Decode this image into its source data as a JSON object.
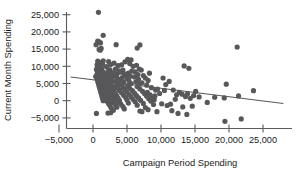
{
  "chart_data": {
    "type": "scatter",
    "title": "",
    "xlabel": "Campaign Period Spending",
    "ylabel": "Current Month Spending",
    "xlim": [
      -6500,
      28500
    ],
    "ylim": [
      -7500,
      27000
    ],
    "xticks": [
      -5000,
      0,
      5000,
      10000,
      15000,
      20000,
      25000
    ],
    "xticklabels": [
      "−5,000",
      "0",
      "5,000",
      "10,000",
      "15,000",
      "20,000",
      "25,000"
    ],
    "yticks": [
      -5000,
      0,
      5000,
      10000,
      15000,
      20000,
      25000
    ],
    "yticklabels": [
      "−5,000",
      "0",
      "5,000",
      "10,000",
      "15,000",
      "20,000",
      "25,000"
    ],
    "grid": false,
    "legend": null,
    "marker_color": "#58585a",
    "marker_size": 2.6,
    "trendline": {
      "label": "linear fit",
      "color": "#58585a",
      "x0": -3300,
      "y0": 6900,
      "x1": 28000,
      "y1": -800
    },
    "points": [
      [
        800,
        25700
      ],
      [
        1500,
        19000
      ],
      [
        700,
        17300
      ],
      [
        900,
        17100
      ],
      [
        1100,
        16800
      ],
      [
        450,
        16300
      ],
      [
        3400,
        16300
      ],
      [
        6900,
        16200
      ],
      [
        21200,
        15600
      ],
      [
        6500,
        15300
      ],
      [
        1200,
        15200
      ],
      [
        900,
        14900
      ],
      [
        1050,
        14700
      ],
      [
        5100,
        12000
      ],
      [
        5600,
        11900
      ],
      [
        1500,
        11600
      ],
      [
        700,
        11500
      ],
      [
        2300,
        11400
      ],
      [
        4700,
        11300
      ],
      [
        1000,
        11100
      ],
      [
        3100,
        10900
      ],
      [
        5400,
        10800
      ],
      [
        900,
        10700
      ],
      [
        1400,
        10600
      ],
      [
        2600,
        10500
      ],
      [
        600,
        10400
      ],
      [
        4200,
        10400
      ],
      [
        6400,
        10300
      ],
      [
        1100,
        10200
      ],
      [
        3700,
        10200
      ],
      [
        13400,
        10100
      ],
      [
        5900,
        10000
      ],
      [
        800,
        9900
      ],
      [
        2000,
        9900
      ],
      [
        14100,
        9400
      ],
      [
        1300,
        9300
      ],
      [
        3300,
        9200
      ],
      [
        6800,
        9200
      ],
      [
        500,
        9100
      ],
      [
        2500,
        9000
      ],
      [
        4400,
        8900
      ],
      [
        7100,
        8900
      ],
      [
        1000,
        8800
      ],
      [
        3800,
        8700
      ],
      [
        5700,
        8600
      ],
      [
        900,
        8500
      ],
      [
        2200,
        8500
      ],
      [
        6200,
        8400
      ],
      [
        1500,
        8300
      ],
      [
        4000,
        8300
      ],
      [
        700,
        8200
      ],
      [
        3000,
        8100
      ],
      [
        5200,
        8000
      ],
      [
        8300,
        8000
      ],
      [
        1200,
        7900
      ],
      [
        2700,
        7900
      ],
      [
        4600,
        7800
      ],
      [
        600,
        7700
      ],
      [
        3500,
        7700
      ],
      [
        6600,
        7600
      ],
      [
        1800,
        7500
      ],
      [
        800,
        7400
      ],
      [
        4900,
        7400
      ],
      [
        2400,
        7300
      ],
      [
        7400,
        7300
      ],
      [
        1100,
        7200
      ],
      [
        3200,
        7200
      ],
      [
        5500,
        7100
      ],
      [
        400,
        7000
      ],
      [
        2900,
        7000
      ],
      [
        6100,
        6900
      ],
      [
        1600,
        6800
      ],
      [
        900,
        6800
      ],
      [
        4300,
        6700
      ],
      [
        2100,
        6600
      ],
      [
        7700,
        6600
      ],
      [
        1300,
        6500
      ],
      [
        3600,
        6500
      ],
      [
        5000,
        6400
      ],
      [
        600,
        6300
      ],
      [
        2600,
        6300
      ],
      [
        6700,
        6200
      ],
      [
        1900,
        6100
      ],
      [
        1000,
        6100
      ],
      [
        4100,
        6000
      ],
      [
        2300,
        5900
      ],
      [
        8100,
        5900
      ],
      [
        1400,
        5800
      ],
      [
        3400,
        5800
      ],
      [
        5300,
        5700
      ],
      [
        700,
        5600
      ],
      [
        2800,
        5600
      ],
      [
        6300,
        5500
      ],
      [
        1700,
        5400
      ],
      [
        1100,
        5400
      ],
      [
        4500,
        5300
      ],
      [
        2200,
        5200
      ],
      [
        7200,
        5200
      ],
      [
        1500,
        5100
      ],
      [
        3700,
        5100
      ],
      [
        5600,
        5000
      ],
      [
        800,
        4900
      ],
      [
        2500,
        4900
      ],
      [
        6800,
        4800
      ],
      [
        1800,
        4700
      ],
      [
        1200,
        4700
      ],
      [
        4000,
        4600
      ],
      [
        2400,
        4500
      ],
      [
        7900,
        4500
      ],
      [
        1600,
        4400
      ],
      [
        3300,
        4400
      ],
      [
        5100,
        4300
      ],
      [
        900,
        4200
      ],
      [
        2700,
        4200
      ],
      [
        6500,
        4100
      ],
      [
        2000,
        4000
      ],
      [
        1300,
        4000
      ],
      [
        4400,
        3900
      ],
      [
        2600,
        3800
      ],
      [
        8600,
        3800
      ],
      [
        1700,
        3700
      ],
      [
        3600,
        3700
      ],
      [
        5400,
        3600
      ],
      [
        1000,
        3500
      ],
      [
        2900,
        3500
      ],
      [
        6900,
        3400
      ],
      [
        2100,
        3300
      ],
      [
        1400,
        3300
      ],
      [
        4700,
        3200
      ],
      [
        2800,
        3100
      ],
      [
        9200,
        3100
      ],
      [
        1900,
        3000
      ],
      [
        3900,
        3000
      ],
      [
        5800,
        2900
      ],
      [
        1100,
        2800
      ],
      [
        3100,
        2800
      ],
      [
        7300,
        2700
      ],
      [
        2300,
        2600
      ],
      [
        1500,
        2600
      ],
      [
        5000,
        2500
      ],
      [
        3000,
        2400
      ],
      [
        8000,
        2400
      ],
      [
        2000,
        2300
      ],
      [
        4200,
        2300
      ],
      [
        6100,
        2200
      ],
      [
        1200,
        2100
      ],
      [
        3300,
        2100
      ],
      [
        7600,
        2000
      ],
      [
        2500,
        1900
      ],
      [
        1600,
        1900
      ],
      [
        5300,
        1800
      ],
      [
        3200,
        1700
      ],
      [
        8400,
        1700
      ],
      [
        2200,
        1600
      ],
      [
        4500,
        1600
      ],
      [
        6400,
        1500
      ],
      [
        1300,
        1400
      ],
      [
        3500,
        1400
      ],
      [
        7900,
        1300
      ],
      [
        2700,
        1200
      ],
      [
        1800,
        1200
      ],
      [
        5600,
        1100
      ],
      [
        3400,
        1000
      ],
      [
        8800,
        1000
      ],
      [
        2400,
        900
      ],
      [
        4800,
        900
      ],
      [
        6700,
        800
      ],
      [
        1400,
        700
      ],
      [
        3700,
        700
      ],
      [
        8200,
        600
      ],
      [
        2900,
        500
      ],
      [
        1900,
        500
      ],
      [
        5900,
        400
      ],
      [
        3600,
        300
      ],
      [
        9000,
        300
      ],
      [
        2600,
        200
      ],
      [
        5000,
        200
      ],
      [
        7000,
        100
      ],
      [
        1500,
        0
      ],
      [
        3900,
        0
      ],
      [
        8500,
        -100
      ],
      [
        3100,
        -200
      ],
      [
        2100,
        -200
      ],
      [
        6200,
        -300
      ],
      [
        3800,
        -400
      ],
      [
        2800,
        -600
      ],
      [
        5200,
        -700
      ],
      [
        7400,
        -800
      ],
      [
        2300,
        -900
      ],
      [
        4100,
        -1000
      ],
      [
        3300,
        -1200
      ],
      [
        6500,
        -1300
      ],
      [
        2500,
        -1500
      ],
      [
        4400,
        -1700
      ],
      [
        3500,
        -1900
      ],
      [
        7700,
        -2000
      ],
      [
        2700,
        -2200
      ],
      [
        4600,
        -2400
      ],
      [
        8100,
        -2600
      ],
      [
        3000,
        -2800
      ],
      [
        6900,
        -3000
      ],
      [
        7200,
        -3200
      ],
      [
        500,
        -3700
      ],
      [
        2200,
        -3600
      ],
      [
        2600,
        -3500
      ],
      [
        9400,
        -3200
      ],
      [
        10300,
        6600
      ],
      [
        10700,
        4700
      ],
      [
        11200,
        5600
      ],
      [
        11800,
        3100
      ],
      [
        12300,
        1700
      ],
      [
        12700,
        2400
      ],
      [
        13100,
        1900
      ],
      [
        13600,
        1200
      ],
      [
        13900,
        2000
      ],
      [
        14300,
        700
      ],
      [
        14800,
        1500
      ],
      [
        12500,
        -3700
      ],
      [
        13800,
        -4000
      ],
      [
        11400,
        -1000
      ],
      [
        10100,
        -900
      ],
      [
        15600,
        1100
      ],
      [
        16800,
        -500
      ],
      [
        17900,
        1000
      ],
      [
        19300,
        800
      ],
      [
        19600,
        4800
      ],
      [
        19400,
        -6000
      ],
      [
        21800,
        -5300
      ],
      [
        21400,
        1400
      ],
      [
        23600,
        2900
      ],
      [
        9800,
        2100
      ],
      [
        9500,
        3400
      ],
      [
        10900,
        -1400
      ],
      [
        12100,
        400
      ],
      [
        14600,
        -1600
      ],
      [
        15100,
        2700
      ],
      [
        8900,
        -1100
      ],
      [
        9100,
        1400
      ],
      [
        10500,
        3000
      ],
      [
        11600,
        -2900
      ],
      [
        13200,
        -1800
      ]
    ]
  },
  "axis": {
    "y_title": "Current Month Spending",
    "x_title": "Campaign Period Spending"
  }
}
